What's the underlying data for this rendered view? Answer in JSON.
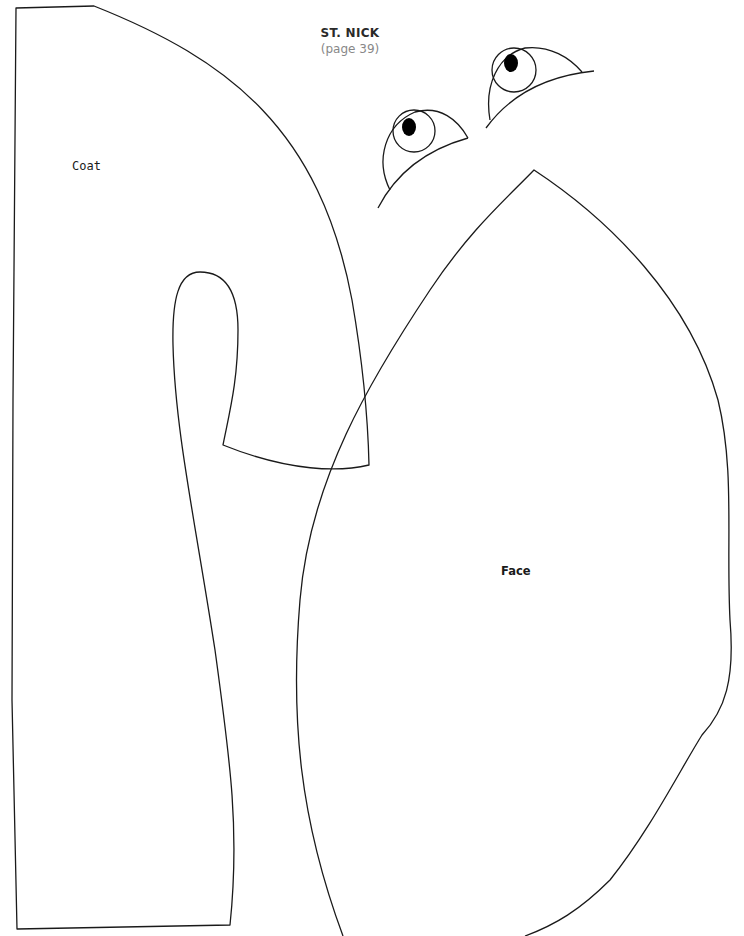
{
  "document": {
    "title": "ST. NICK",
    "subtitle": "(page 39)"
  },
  "pieces": [
    {
      "id": "coat",
      "label": "Coat"
    },
    {
      "id": "face",
      "label": "Face"
    },
    {
      "id": "eye-left",
      "label": ""
    },
    {
      "id": "eye-right",
      "label": ""
    }
  ],
  "colors": {
    "line": "#1a1a1a",
    "pupil": "#000000",
    "background": "#ffffff"
  }
}
